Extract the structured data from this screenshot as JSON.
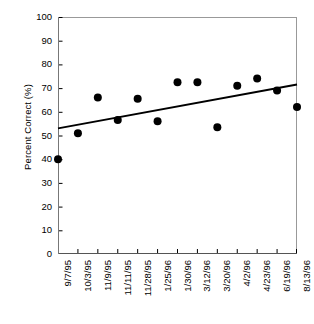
{
  "chart_data": {
    "type": "scatter",
    "title": "",
    "xlabel": "",
    "ylabel": "Percent Correct (%)",
    "ylim": [
      0,
      100
    ],
    "ytick_step": 10,
    "yticks": [
      100,
      90,
      80,
      70,
      60,
      50,
      40,
      30,
      20,
      10,
      0
    ],
    "grid": false,
    "legend": "none",
    "categories": [
      "9/7/95",
      "10/3/95",
      "11/9/95",
      "11/11/95",
      "11/28/95",
      "1/25/96",
      "1/30/96",
      "3/12/96",
      "3/20/96",
      "4/2/96",
      "4/23/96",
      "6/19/96",
      "8/13/96"
    ],
    "values": [
      40,
      51,
      66,
      56.5,
      65.5,
      56,
      72.5,
      72.5,
      53.5,
      71,
      74,
      69,
      62
    ],
    "series": [
      {
        "name": "Percent Correct",
        "marker": "filled-circle",
        "color": "#000000",
        "values": [
          40,
          51,
          66,
          56.5,
          65.5,
          56,
          72.5,
          72.5,
          53.5,
          71,
          74,
          69,
          62
        ]
      }
    ],
    "trendline": {
      "name": "Linear trend",
      "color": "#000000",
      "start_value": 53,
      "end_value": 71.5
    }
  },
  "axes": {
    "y_title": "Percent Correct (%)",
    "frame_color": "#999999",
    "tick_color": "#000000"
  }
}
